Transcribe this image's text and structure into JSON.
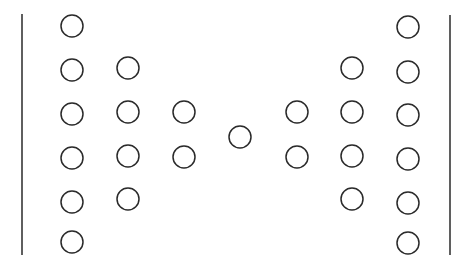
{
  "diagram": {
    "width": 467,
    "height": 271,
    "stroke_color": "#2a2a2a",
    "background": "#ffffff",
    "circle_radius": 11,
    "circle_stroke_width": 1.5,
    "line_stroke_width": 1.5,
    "lines": [
      {
        "name": "left-boundary-line",
        "x": 22,
        "y1": 14,
        "y2": 255
      },
      {
        "name": "right-boundary-line",
        "x": 450,
        "y1": 15,
        "y2": 255
      }
    ],
    "columns": [
      {
        "name": "left-column-1",
        "cx": 72,
        "cy": [
          26,
          70,
          114,
          158,
          202,
          242
        ]
      },
      {
        "name": "left-column-2",
        "cx": 128,
        "cy": [
          68,
          112,
          156,
          199
        ]
      },
      {
        "name": "left-column-3",
        "cx": 184,
        "cy": [
          112,
          157
        ]
      },
      {
        "name": "center-column",
        "cx": 240,
        "cy": [
          137
        ]
      },
      {
        "name": "right-column-3",
        "cx": 297,
        "cy": [
          112,
          157
        ]
      },
      {
        "name": "right-column-2",
        "cx": 352,
        "cy": [
          68,
          112,
          156,
          199
        ]
      },
      {
        "name": "right-column-1",
        "cx": 408,
        "cy": [
          27,
          72,
          115,
          159,
          203,
          243
        ]
      }
    ]
  }
}
